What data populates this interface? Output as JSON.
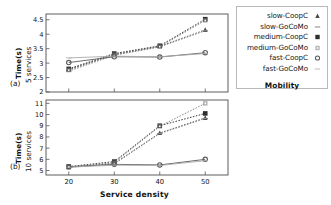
{
  "chart_data": [
    {
      "panel": "(a)",
      "type": "line",
      "title": "",
      "xlabel": "Service density",
      "ylabel": "Time(s)",
      "ylabel2": "5 services",
      "x": [
        20,
        30,
        40,
        50
      ],
      "xlim": [
        15,
        55
      ],
      "ylim": [
        2,
        4.7
      ],
      "xticks": [
        "20",
        "30",
        "40",
        "50"
      ],
      "yticks": [
        "2",
        "2.5",
        "3",
        "3.5",
        "4",
        "4.5"
      ],
      "grid": false,
      "series": [
        {
          "name": "slow-CoopC",
          "values": [
            2.78,
            3.3,
            3.58,
            4.15
          ],
          "marker": "triangle",
          "color": "#4a4a4a"
        },
        {
          "name": "slow-GoCoMo",
          "values": [
            2.72,
            3.27,
            3.56,
            4.12
          ],
          "marker": "dash",
          "color": "#8a8a8a"
        },
        {
          "name": "medium-CoopC",
          "values": [
            2.8,
            3.33,
            3.6,
            4.52
          ],
          "marker": "square",
          "color": "#2e2e2e"
        },
        {
          "name": "medium-GoCoMo",
          "values": [
            2.76,
            3.29,
            3.57,
            4.48
          ],
          "marker": "dotsquare",
          "color": "#7b7b7b"
        },
        {
          "name": "fast-CoopC",
          "values": [
            3.02,
            3.22,
            3.21,
            3.36
          ],
          "marker": "circle",
          "color": "#5a5a5a"
        },
        {
          "name": "fast-GoCoMo",
          "values": [
            3.18,
            3.24,
            3.22,
            3.33
          ],
          "marker": "plain",
          "color": "#a9a9a9"
        }
      ]
    },
    {
      "panel": "(b)",
      "type": "line",
      "title": "",
      "xlabel": "Service density",
      "ylabel": "Time(s)",
      "ylabel2": "10 services",
      "x": [
        20,
        30,
        40,
        50
      ],
      "xlim": [
        15,
        55
      ],
      "ylim": [
        4.6,
        11.3
      ],
      "xticks": [
        "20",
        "30",
        "40",
        "50"
      ],
      "yticks": [
        "5",
        "6",
        "7",
        "8",
        "9",
        "10",
        "11"
      ],
      "grid": false,
      "series": [
        {
          "name": "slow-CoopC",
          "values": [
            5.3,
            5.62,
            8.35,
            9.7
          ],
          "marker": "triangle",
          "color": "#4a4a4a"
        },
        {
          "name": "slow-GoCoMo",
          "values": [
            5.28,
            5.58,
            8.3,
            9.65
          ],
          "marker": "dash",
          "color": "#8a8a8a"
        },
        {
          "name": "medium-CoopC",
          "values": [
            5.35,
            5.8,
            9.0,
            10.1
          ],
          "marker": "square",
          "color": "#2e2e2e"
        },
        {
          "name": "medium-GoCoMo",
          "values": [
            5.32,
            5.7,
            8.95,
            11.0
          ],
          "marker": "dotsquare",
          "color": "#7b7b7b"
        },
        {
          "name": "fast-CoopC",
          "values": [
            5.33,
            5.55,
            5.5,
            6.0
          ],
          "marker": "circle",
          "color": "#5a5a5a"
        },
        {
          "name": "fast-GoCoMo",
          "values": [
            5.3,
            5.48,
            5.45,
            5.88
          ],
          "marker": "plain",
          "color": "#a9a9a9"
        }
      ]
    }
  ],
  "legend": {
    "title": "Mobility",
    "items": [
      {
        "label": "slow-CoopC",
        "marker": "triangle"
      },
      {
        "label": "slow-GoCoMo",
        "marker": "dash"
      },
      {
        "label": "medium-CoopC",
        "marker": "square"
      },
      {
        "label": "medium-GoCoMo",
        "marker": "dotsquare"
      },
      {
        "label": "fast-CoopC",
        "marker": "circle"
      },
      {
        "label": "fast-GoCoMo",
        "marker": "plain"
      }
    ]
  },
  "axes": {
    "x_title": "Service density",
    "y_title": "Time(s)",
    "panel_a_sub": "5 services",
    "panel_b_sub": "10 services",
    "panel_a_tag": "(a)",
    "panel_b_tag": "(b)"
  },
  "colors": {
    "axis": "#555555",
    "frame": "#4d4d4d",
    "text": "#111111",
    "legend_border": "#b9b9b9"
  }
}
